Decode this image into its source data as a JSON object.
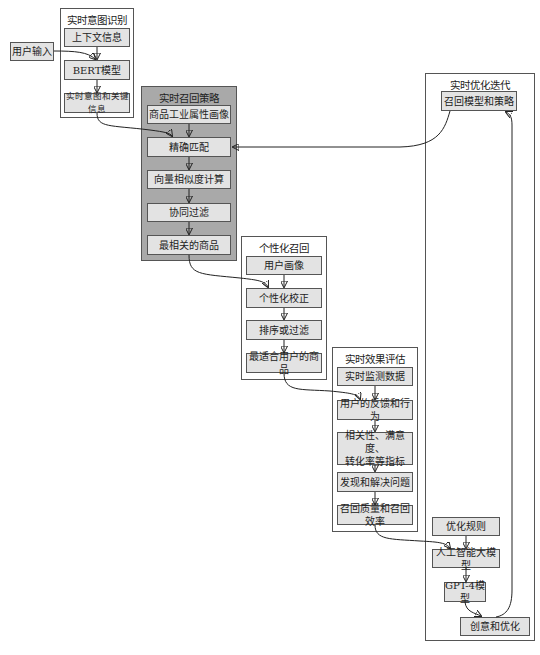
{
  "diagram": {
    "type": "flowchart",
    "clusters": [
      {
        "id": "intent",
        "title": "实时意图识别",
        "nodes": [
          "上下文信息",
          "BERT模型",
          "实时意图和关键信息"
        ]
      },
      {
        "id": "recall",
        "title": "实时召回策略",
        "nodes": [
          "商品工业属性画像",
          "精确匹配",
          "向量相似度计算",
          "协同过滤",
          "最相关的商品"
        ]
      },
      {
        "id": "personal",
        "title": "个性化召回",
        "nodes": [
          "用户画像",
          "个性化校正",
          "排序或过滤",
          "最适合用户的商品"
        ]
      },
      {
        "id": "eval",
        "title": "实时效果评估",
        "nodes": [
          "实时监测数据",
          "用户的反馈和行为",
          "相关性、满意度、\n转化率等指标",
          "发现和解决问题",
          "召回质量和召回效率"
        ]
      },
      {
        "id": "optimize",
        "title": "实时优化迭代",
        "nodes": [
          "召回模型和策略",
          "优化规则",
          "人工智能大模型",
          "GPT-4模型",
          "创意和优化"
        ]
      }
    ],
    "standalone_nodes": [
      "用户输入"
    ],
    "edges": [
      [
        "用户输入",
        "BERT模型"
      ],
      [
        "上下文信息",
        "BERT模型"
      ],
      [
        "BERT模型",
        "实时意图和关键信息"
      ],
      [
        "实时意图和关键信息",
        "精确匹配"
      ],
      [
        "商品工业属性画像",
        "精确匹配"
      ],
      [
        "召回模型和策略",
        "精确匹配"
      ],
      [
        "精确匹配",
        "向量相似度计算"
      ],
      [
        "向量相似度计算",
        "协同过滤"
      ],
      [
        "协同过滤",
        "最相关的商品"
      ],
      [
        "最相关的商品",
        "个性化校正"
      ],
      [
        "用户画像",
        "个性化校正"
      ],
      [
        "个性化校正",
        "排序或过滤"
      ],
      [
        "排序或过滤",
        "最适合用户的商品"
      ],
      [
        "最适合用户的商品",
        "用户的反馈和行为"
      ],
      [
        "实时监测数据",
        "用户的反馈和行为"
      ],
      [
        "用户的反馈和行为",
        "相关性、满意度、转化率等指标"
      ],
      [
        "相关性、满意度、转化率等指标",
        "发现和解决问题"
      ],
      [
        "发现和解决问题",
        "召回质量和召回效率"
      ],
      [
        "召回质量和召回效率",
        "人工智能大模型"
      ],
      [
        "优化规则",
        "人工智能大模型"
      ],
      [
        "人工智能大模型",
        "GPT-4模型"
      ],
      [
        "GPT-4模型",
        "创意和优化"
      ],
      [
        "创意和优化",
        "召回模型和策略"
      ]
    ]
  },
  "intent": {
    "title": "实时意图识别",
    "context": "上下文信息",
    "bert": "BERT模型",
    "result": "实时意图和关键信息"
  },
  "user_input": "用户输入",
  "recall": {
    "title": "实时召回策略",
    "profile": "商品工业属性画像",
    "exact": "精确匹配",
    "vector": "向量相似度计算",
    "cf": "协同过滤",
    "best": "最相关的商品"
  },
  "personal": {
    "title": "个性化召回",
    "user_profile": "用户画像",
    "correct": "个性化校正",
    "sort": "排序或过滤",
    "best": "最适合用户的商品"
  },
  "eval": {
    "title": "实时效果评估",
    "monitor": "实时监测数据",
    "feedback": "用户的反馈和行为",
    "metrics": "相关性、满意度、\n转化率等指标",
    "issues": "发现和解决问题",
    "quality": "召回质量和召回效率"
  },
  "optimize": {
    "title": "实时优化迭代",
    "model": "召回模型和策略",
    "rules": "优化规则",
    "llm": "人工智能大模型",
    "gpt": "GPT-4模型",
    "creative": "创意和优化"
  }
}
